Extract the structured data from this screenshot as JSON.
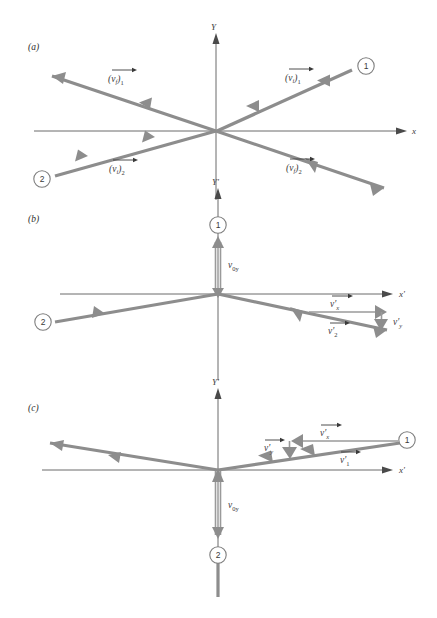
{
  "figure": {
    "colors": {
      "vector": "#8d8d8d",
      "axis": "#6b6b6b",
      "text": "#3a3a3a",
      "background": "#ffffff"
    },
    "panels": [
      {
        "id": "a",
        "label": "(a)",
        "axis_x_label": "x",
        "axis_y_label": "Y",
        "particles": [
          {
            "name": "particle-1",
            "number": "1"
          },
          {
            "name": "particle-2",
            "number": "2"
          }
        ],
        "vectors": [
          {
            "name": "v-f-1",
            "base": "v",
            "sub": "f",
            "group_sub": "1",
            "arrow": true,
            "paren": true
          },
          {
            "name": "v-i-1",
            "base": "v",
            "sub": "i",
            "group_sub": "1",
            "arrow": true,
            "paren": true
          },
          {
            "name": "v-i-2",
            "base": "v",
            "sub": "i",
            "group_sub": "2",
            "arrow": true,
            "paren": true
          },
          {
            "name": "v-f-2",
            "base": "v",
            "sub": "f",
            "group_sub": "2",
            "arrow": true,
            "paren": true
          }
        ]
      },
      {
        "id": "b",
        "label": "(b)",
        "axis_x_label": "x'",
        "axis_y_label": "Y'",
        "particles": [
          {
            "name": "particle-1",
            "number": "1"
          },
          {
            "name": "particle-2",
            "number": "2"
          }
        ],
        "vectors": [
          {
            "name": "v-0y",
            "base": "v",
            "sub": "0y",
            "arrow": false
          },
          {
            "name": "v-prime-x",
            "base": "v'",
            "sub": "x",
            "arrow": true
          },
          {
            "name": "v-prime-y",
            "base": "v'",
            "sub": "y",
            "arrow": false
          },
          {
            "name": "v-prime-2",
            "base": "v'",
            "sub": "2",
            "arrow": true
          }
        ]
      },
      {
        "id": "c",
        "label": "(c)",
        "axis_x_label": "x'",
        "axis_y_label": "Y'",
        "particles": [
          {
            "name": "particle-1",
            "number": "1"
          },
          {
            "name": "particle-2",
            "number": "2"
          }
        ],
        "vectors": [
          {
            "name": "v-0y",
            "base": "v",
            "sub": "0y",
            "arrow": false
          },
          {
            "name": "v-prime-x",
            "base": "v'",
            "sub": "x",
            "arrow": true
          },
          {
            "name": "v-prime-y",
            "base": "v'",
            "sub": "y",
            "arrow": true
          },
          {
            "name": "v-prime-1",
            "base": "v'",
            "sub": "1",
            "arrow": true
          }
        ]
      }
    ]
  },
  "labels": {
    "panel_a": "(a)",
    "panel_b": "(b)",
    "panel_c": "(c)",
    "axis_x": "x",
    "axis_y": "Y",
    "axis_x_prime": "x'",
    "axis_y_prime": "Y'",
    "num_1": "1",
    "num_2": "2",
    "v": "v",
    "v_prime": "v'",
    "sub_f": "f",
    "sub_i": "i",
    "sub_1": "1",
    "sub_2": "2",
    "sub_x": "x",
    "sub_y": "y",
    "sub_0y": "0y",
    "paren_open": "(",
    "paren_close": ")"
  }
}
